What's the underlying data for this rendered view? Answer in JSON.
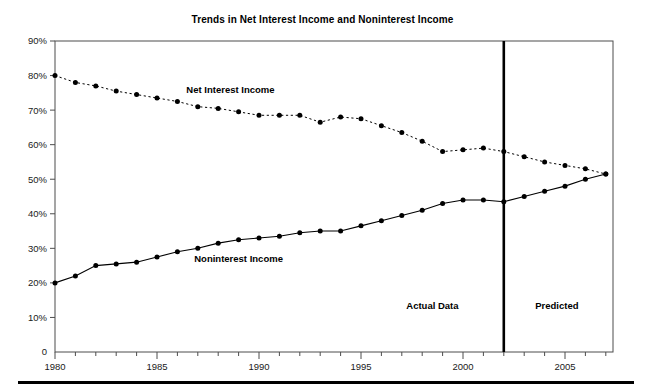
{
  "chart_data": {
    "type": "line",
    "title": "Trends in Net Interest Income and Noninterest Income",
    "xlabel": "",
    "ylabel": "",
    "xlim": [
      1980,
      2007.5
    ],
    "ylim": [
      0,
      90
    ],
    "grid": false,
    "legend_position": "inline-annotation",
    "y_ticks": [
      "0",
      "10%",
      "20%",
      "30%",
      "40%",
      "50%",
      "60%",
      "70%",
      "80%",
      "90%"
    ],
    "y_tick_values": [
      0,
      10,
      20,
      30,
      40,
      50,
      60,
      70,
      80,
      90
    ],
    "x_ticks": [
      "1980",
      "1985",
      "1990",
      "1995",
      "2000",
      "2005"
    ],
    "x_tick_values": [
      1980,
      1985,
      1990,
      1995,
      2000,
      2005
    ],
    "x_minor_tick_values": [
      1981,
      1982,
      1983,
      1984,
      1986,
      1987,
      1988,
      1989,
      1991,
      1992,
      1993,
      1994,
      1996,
      1997,
      1998,
      1999,
      2001,
      2002,
      2003,
      2004,
      2006,
      2007
    ],
    "x": [
      1980,
      1981,
      1982,
      1983,
      1984,
      1985,
      1986,
      1987,
      1988,
      1989,
      1990,
      1991,
      1992,
      1993,
      1994,
      1995,
      1996,
      1997,
      1998,
      1999,
      2000,
      2001,
      2002,
      2003,
      2004,
      2005,
      2006,
      2007
    ],
    "series": [
      {
        "name": "Net Interest Income",
        "style": "dashed",
        "marker": "circle",
        "color": "#000000",
        "label_x": 1988.6,
        "label_y": 75.0,
        "values": [
          80,
          78,
          77,
          75.5,
          74.5,
          73.5,
          72.5,
          71,
          70.5,
          69.5,
          68.5,
          68.5,
          68.5,
          66.5,
          68,
          67.5,
          65.5,
          63.5,
          61,
          58,
          58.5,
          59,
          58,
          56.5,
          55,
          54,
          53,
          51.5
        ]
      },
      {
        "name": "Noninterest Income",
        "style": "solid",
        "marker": "circle",
        "color": "#000000",
        "label_x": 1989.0,
        "label_y": 26.0,
        "values": [
          20,
          22,
          25,
          25.5,
          26,
          27.5,
          29,
          30,
          31.5,
          32.5,
          33,
          33.5,
          34.5,
          35,
          35,
          36.5,
          38,
          39.5,
          41,
          43,
          44,
          44,
          43.5,
          45,
          46.5,
          48,
          50,
          51.5
        ]
      }
    ],
    "annotations": [
      {
        "id": "divider",
        "type": "vline",
        "x": 2002,
        "label": ""
      },
      {
        "id": "actual-data-label",
        "type": "text",
        "label": "Actual Data",
        "x": 1998.5,
        "y": 12.5
      },
      {
        "id": "predicted-label",
        "type": "text",
        "label": "Predicted",
        "x": 2004.6,
        "y": 12.5
      }
    ],
    "colors": {
      "frame": "#4d4d4d",
      "line": "#000000",
      "divider": "#000000",
      "text": "#000000",
      "background": "#ffffff"
    }
  }
}
